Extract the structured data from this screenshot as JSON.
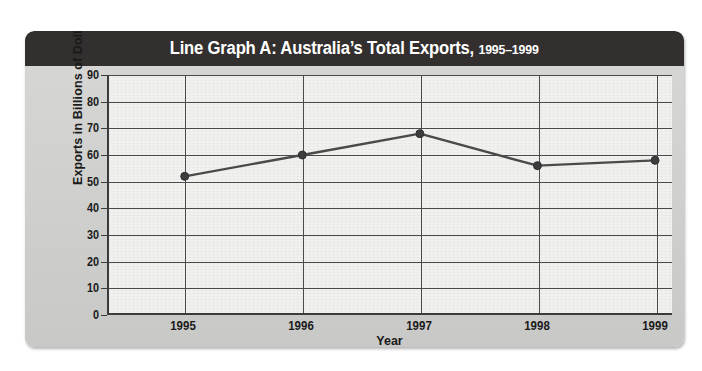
{
  "card": {
    "title_main": "Line Graph A: Australia’s Total Exports,",
    "title_range": "1995–1999"
  },
  "chart_data": {
    "type": "line",
    "title": "Line Graph A: Australia’s Total Exports, 1995–1999",
    "xlabel": "Year",
    "ylabel": "Exports in Billions of Dollars",
    "categories": [
      "1995",
      "1996",
      "1997",
      "1998",
      "1999"
    ],
    "values": [
      52,
      60,
      68,
      56,
      58
    ],
    "ylim": [
      0,
      90
    ],
    "ytick_step": 10,
    "yticks": [
      "90",
      "80",
      "70",
      "60",
      "50",
      "40",
      "30",
      "20",
      "10",
      "0"
    ],
    "grid": "both",
    "legend": "none",
    "series": [
      {
        "name": "Total Exports",
        "values": [
          52,
          60,
          68,
          56,
          58
        ],
        "line_color": "#4a4a4a",
        "marker": "circle",
        "marker_color": "#3d3d3d"
      }
    ]
  },
  "colors": {
    "title_bar": "#332f2e",
    "title_text": "#ffffff",
    "card_body": "#d2d2d0",
    "plot_background": "#f1f1ef",
    "gridline": "#4a4a4a",
    "axis": "#3b3b3b",
    "data_line": "#4a4a4a"
  }
}
